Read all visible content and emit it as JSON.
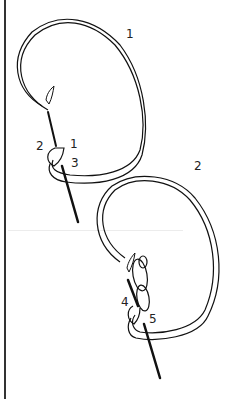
{
  "diagram": {
    "steps": [
      {
        "id": "step-1",
        "label": "1"
      },
      {
        "id": "step-2",
        "label": "2"
      }
    ],
    "points": {
      "p1": "1",
      "p2": "2",
      "p3": "3",
      "p4": "4",
      "p5": "5"
    },
    "colors": {
      "line": "#111111",
      "background": "#ffffff"
    }
  }
}
